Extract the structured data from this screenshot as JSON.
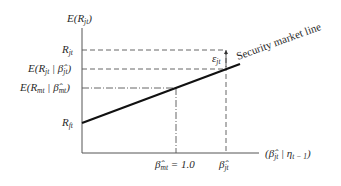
{
  "diagram": {
    "y_axis_label": "E(R_jt)",
    "x_axis_label": "(β̂_jt | η_t−1)",
    "line_label": "Security market line",
    "error_label": "ε_jt",
    "y_ticks": [
      {
        "label": "R_jt",
        "kind": "dashed"
      },
      {
        "label": "E(R_jt | β̂_jt)",
        "kind": "dashed"
      },
      {
        "label": "E(R_mt | β̂_mt)",
        "kind": "dash-dot"
      },
      {
        "label": "R_ft",
        "kind": "intercept"
      }
    ],
    "x_ticks": [
      {
        "label": "β̂_mt = 1.0",
        "kind": "dash-dot"
      },
      {
        "label": "β̂_jt",
        "kind": "dashed"
      }
    ],
    "colors": {
      "axis": "#555555",
      "line": "#111111",
      "guide": "#555555",
      "text": "#2a2a2a"
    }
  }
}
